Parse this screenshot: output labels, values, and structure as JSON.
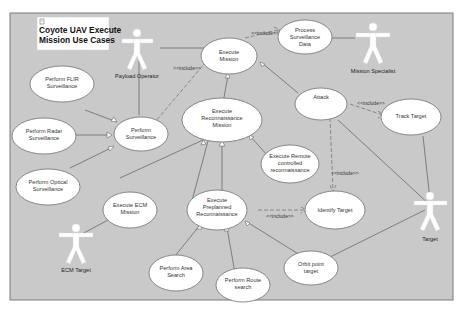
{
  "diagram": {
    "title_line1": "Coyote UAV Execute",
    "title_line2": "Mission Use Cases",
    "title_icon": "note-icon",
    "colors": {
      "background": "#c9c9c9",
      "use_case_fill": "#ffffff",
      "actor_fill": "#ffffff",
      "line": "#6a6a6a"
    },
    "actors": {
      "payload_operator": "Payload Operator",
      "mission_specialist": "Mission Specialist",
      "ecm_target": "ECM Target",
      "target": "Target"
    },
    "use_cases": {
      "execute_mission": [
        "Execute",
        "Mission"
      ],
      "process_surveillance_data": [
        "Process",
        "Surveillance",
        "Data"
      ],
      "perform_flir": [
        "Perform FLIR",
        "Surveillance"
      ],
      "perform_radar": [
        "Perform Radar",
        "Surveillance"
      ],
      "perform_optical": [
        "Perform Optical",
        "Surveillance"
      ],
      "perform_surveillance": [
        "Perform",
        "Surveillance"
      ],
      "execute_recon_mission": [
        "Execute",
        "Reconnaissance",
        "Mission"
      ],
      "attack": [
        "Attack"
      ],
      "track_target": [
        "Track Target"
      ],
      "execute_remote_recon": [
        "Execute Remote",
        "controlled",
        "reconnaissance"
      ],
      "execute_ecm_mission": [
        "Execute ECM",
        "Mission"
      ],
      "execute_preplanned_recon": [
        "Execute",
        "Preplanned",
        "Reconnaissance"
      ],
      "identify_target": [
        "Identify Target"
      ],
      "perform_area_search": [
        "Perform Area",
        "Search"
      ],
      "perform_route_search": [
        "Perform Route",
        "search"
      ],
      "orbit_point_target": [
        "Orbit point",
        "target"
      ]
    },
    "include_label": "<<include>>"
  }
}
